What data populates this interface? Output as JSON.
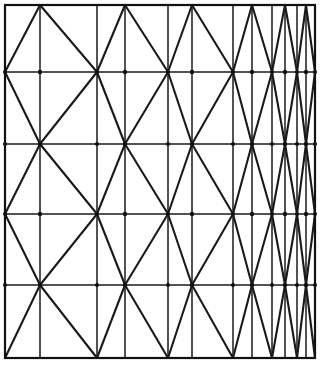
{
  "figure": {
    "type": "geometric-line-diagram",
    "background_color": "#ffffff",
    "line_color": "#1a1a1a",
    "canvas": {
      "width": 321,
      "height": 366
    },
    "frame": {
      "left": 5,
      "top": 5,
      "right": 315,
      "bottom": 358
    }
  },
  "chart_data": {
    "type": "line",
    "xlabel": "",
    "ylabel": "",
    "grid": true,
    "legend": "none",
    "xlim": [
      5,
      315
    ],
    "ylim": [
      5,
      358
    ],
    "vertical_lines_x": [
      5,
      40,
      97,
      125,
      168,
      192,
      233,
      252,
      272,
      285,
      297,
      306,
      315
    ],
    "horizontal_lines_y": [
      5,
      72,
      144,
      214,
      285,
      358
    ],
    "row_count": 5,
    "column_count": 12,
    "zigzag_phase_by_row": [
      "odd",
      "even",
      "odd",
      "even",
      "odd"
    ],
    "peaks_row_odd_x": [
      40,
      125,
      192,
      252,
      285,
      306
    ],
    "valleys_row_odd_x": [
      5,
      97,
      168,
      233,
      272,
      297,
      315
    ],
    "peaks_row_even_x": [
      5,
      97,
      168,
      233,
      272,
      297,
      315
    ],
    "valleys_row_even_x": [
      40,
      125,
      192,
      252,
      285,
      306
    ]
  }
}
